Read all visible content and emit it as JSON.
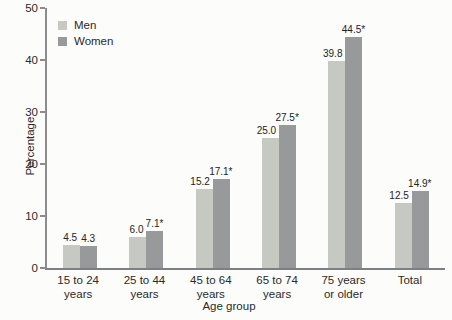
{
  "figure": {
    "background": "#fcfcfa",
    "text_color": "#2b2a28",
    "axis_color": "#8a8c8e"
  },
  "chart_data": {
    "type": "bar",
    "title": "",
    "xlabel": "Age group",
    "ylabel": "Percentage",
    "ylim": [
      0,
      50
    ],
    "yticks": [
      0,
      10,
      20,
      30,
      40,
      50
    ],
    "grid": false,
    "legend_position": "top-left",
    "categories": [
      "15 to 24\nyears",
      "25 to 44\nyears",
      "45 to 64\nyears",
      "65 to 74\nyears",
      "75 years\nor older",
      "Total"
    ],
    "series": [
      {
        "name": "Men",
        "color": "#c6c9c1",
        "values": [
          4.5,
          6.0,
          15.2,
          25.0,
          39.8,
          12.5
        ],
        "labels": [
          "4.5",
          "6.0",
          "15.2",
          "25.0",
          "39.8",
          "12.5"
        ]
      },
      {
        "name": "Women",
        "color": "#97999b",
        "values": [
          4.3,
          7.1,
          17.1,
          27.5,
          44.5,
          14.9
        ],
        "labels": [
          "4.3",
          "7.1*",
          "17.1*",
          "27.5*",
          "44.5*",
          "14.9*"
        ]
      }
    ]
  }
}
